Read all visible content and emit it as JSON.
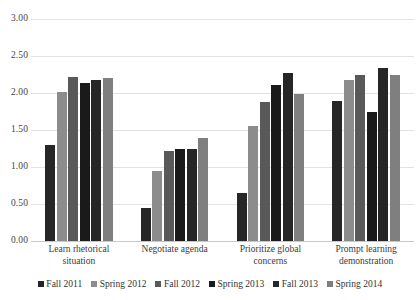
{
  "chart_data": {
    "type": "bar",
    "title": "",
    "xlabel": "",
    "ylabel": "",
    "ylim": [
      0,
      3.0
    ],
    "ytick_step": 0.5,
    "ytick_labels": [
      "3.00",
      "2.50",
      "2.00",
      "1.50",
      "1.00",
      "0.50",
      "0.00"
    ],
    "ytick_values": [
      3.0,
      2.5,
      2.0,
      1.5,
      1.0,
      0.5,
      0.0
    ],
    "grid": true,
    "legend_position": "bottom",
    "categories": [
      "Learn rhetorical situation",
      "Negotiate agenda",
      "Prioritize global concerns",
      "Prompt learning demonstration"
    ],
    "category_lines": [
      [
        "Learn rhetorical",
        "situation"
      ],
      [
        "Negotiate agenda"
      ],
      [
        "Prioritize global",
        "concerns"
      ],
      [
        "Prompt learning",
        "demonstration"
      ]
    ],
    "series": [
      {
        "name": "Fall 2011",
        "color": "#262626",
        "values": [
          1.3,
          0.44,
          0.65,
          1.89
        ]
      },
      {
        "name": "Spring 2012",
        "color": "#8c8c8c",
        "values": [
          2.01,
          0.95,
          1.56,
          2.17
        ]
      },
      {
        "name": "Fall 2012",
        "color": "#595959",
        "values": [
          2.22,
          1.21,
          1.88,
          2.25
        ]
      },
      {
        "name": "Spring 2013",
        "color": "#1a1a1a",
        "values": [
          2.13,
          1.25,
          2.11,
          1.74
        ]
      },
      {
        "name": "Fall 2013",
        "color": "#262626",
        "values": [
          2.17,
          1.24,
          2.27,
          2.34
        ]
      },
      {
        "name": "Spring 2014",
        "color": "#7f7f7f",
        "values": [
          2.2,
          1.39,
          1.99,
          2.24
        ]
      }
    ]
  },
  "legend": {
    "items": [
      {
        "label": "Fall 2011"
      },
      {
        "label": "Spring 2012"
      },
      {
        "label": "Fall 2012"
      },
      {
        "label": "Spring 2013"
      },
      {
        "label": "Fall 2013"
      },
      {
        "label": "Spring 2014"
      }
    ]
  }
}
